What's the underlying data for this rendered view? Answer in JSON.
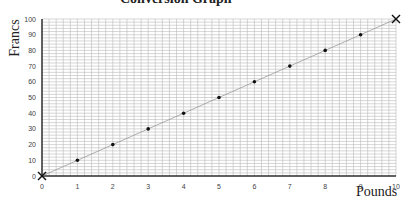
{
  "chart_data": {
    "type": "line",
    "title": "Conversion Graph",
    "xlabel": "Pounds",
    "ylabel": "Francs",
    "xlim": [
      0,
      10
    ],
    "ylim": [
      0,
      100
    ],
    "x_ticks": [
      "0",
      "1",
      "2",
      "3",
      "4",
      "5",
      "6",
      "7",
      "8",
      "9",
      "10"
    ],
    "y_ticks": [
      "0",
      "10",
      "20",
      "30",
      "40",
      "50",
      "60",
      "70",
      "80",
      "90",
      "100"
    ],
    "grid": true,
    "series": [
      {
        "name": "Conversion line",
        "x": [
          0,
          10
        ],
        "y": [
          0,
          100
        ],
        "endpoint_marker": "x"
      },
      {
        "name": "Points",
        "x": [
          1,
          2,
          3,
          4,
          5,
          6,
          7,
          8,
          9
        ],
        "y": [
          10,
          20,
          30,
          40,
          50,
          60,
          70,
          80,
          90
        ],
        "marker": "dot"
      }
    ]
  }
}
